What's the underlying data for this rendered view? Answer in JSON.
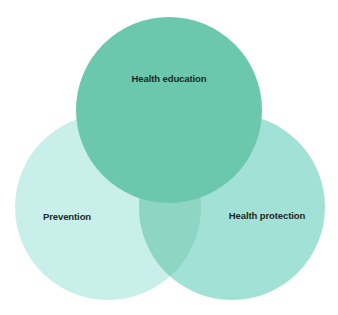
{
  "diagram": {
    "type": "venn",
    "sets": [
      {
        "id": "education",
        "label": "Health education",
        "color": "#6cc8ac",
        "cx": 169,
        "cy": 110,
        "r": 93,
        "label_x": 169,
        "label_y": 78
      },
      {
        "id": "prevention",
        "label": "Prevention",
        "color": "#c8efea",
        "cx": 108,
        "cy": 207,
        "r": 93,
        "label_x": 67,
        "label_y": 216
      },
      {
        "id": "protection",
        "label": "Health protection",
        "color": "#a1e1d6",
        "cx": 232,
        "cy": 207,
        "r": 93,
        "label_x": 267,
        "label_y": 215
      }
    ],
    "overlap_colors": {
      "prevention_protection": "#8fd5c3",
      "top_over": "#6cc8ac"
    }
  }
}
